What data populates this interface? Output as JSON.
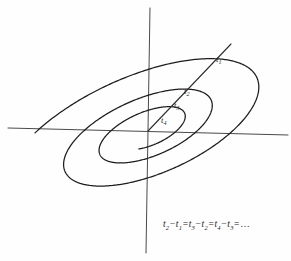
{
  "figure": {
    "background_color": "#fefefe",
    "ink_color": "#1c1c1c",
    "axis_color": "#4a4a4a",
    "width": 291,
    "height": 261
  },
  "axes": {
    "horizontal": {
      "name": "horizontal-axis",
      "x1": 8,
      "y1": 128,
      "x2": 288,
      "y2": 135
    },
    "vertical": {
      "name": "vertical-axis",
      "x1": 150,
      "y1": 8,
      "x2": 146,
      "y2": 253
    },
    "origin": {
      "x": 148,
      "y": 131
    }
  },
  "ray": {
    "name": "radial-ray",
    "x1": 148,
    "y1": 131,
    "x2": 231,
    "y2": 44
  },
  "tick_points": [
    {
      "label": "t",
      "index": "1",
      "x": 212,
      "y": 62,
      "label_x": 216,
      "label_y": 62
    },
    {
      "label": "t",
      "index": "2",
      "x": 181,
      "y": 96,
      "label_x": 184,
      "label_y": 94
    },
    {
      "label": "t",
      "index": "3",
      "x": 172,
      "y": 108,
      "label_x": 174,
      "label_y": 108
    },
    {
      "label": "t",
      "index": "4",
      "x": 160,
      "y": 122,
      "label_x": 161,
      "label_y": 123
    }
  ],
  "equation": {
    "name": "equal-intervals-equation",
    "text": "t2 - t1 = t3 - t2 = t4 - t3 = ...",
    "terms": [
      {
        "var": "t",
        "sub": "2"
      },
      {
        "var": "t",
        "sub": "1"
      },
      {
        "var": "t",
        "sub": "3"
      },
      {
        "var": "t",
        "sub": "2"
      },
      {
        "var": "t",
        "sub": "4"
      },
      {
        "var": "t",
        "sub": "3"
      }
    ],
    "minus": "−",
    "equals": "=",
    "ellipsis": "…"
  },
  "chart_data": {
    "type": "line",
    "xlabel": "",
    "ylabel": "",
    "grid": false,
    "legend": null,
    "annotations": [
      "t1",
      "t2",
      "t3",
      "t4",
      "t2 - t1 = t3 - t2 = t4 - t3 = ..."
    ],
    "series": [
      {
        "name": "spiral",
        "kind": "parametric-log-spiral",
        "center": [
          148,
          131
        ],
        "tilt_degrees": -24,
        "axis_ratio": 0.42,
        "turns": 2.7,
        "r_start": 148,
        "r_end": 34
      }
    ],
    "markers": [
      {
        "name": "t1",
        "x": 212,
        "y": 62
      },
      {
        "name": "t2",
        "x": 181,
        "y": 96
      },
      {
        "name": "t3",
        "x": 172,
        "y": 108
      },
      {
        "name": "t4",
        "x": 160,
        "y": 122
      }
    ]
  }
}
